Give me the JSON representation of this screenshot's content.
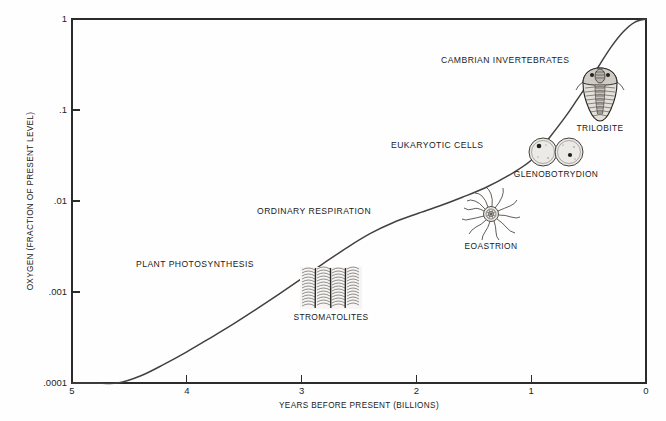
{
  "figure": {
    "background_color": "#fefefe",
    "curve_color": "#44403f",
    "axis_color": "#2b2b2b"
  },
  "chart_data": {
    "type": "line",
    "title": "",
    "xlabel": "YEARS BEFORE PRESENT (BILLIONS)",
    "ylabel": "OXYGEN (FRACTION OF PRESENT LEVEL)",
    "yscale": "log",
    "xlim": [
      5,
      0
    ],
    "ylim": [
      0.0001,
      1
    ],
    "x_reversed": true,
    "grid": false,
    "legend": "none",
    "xticks": [
      "5",
      "4",
      "3",
      "2",
      "1",
      "0"
    ],
    "xtick_values": [
      5,
      4,
      3,
      2,
      1,
      0
    ],
    "yticks": [
      "1",
      ".1",
      ".01",
      ".001",
      ".0001"
    ],
    "ytick_values": [
      1,
      0.1,
      0.01,
      0.001,
      0.0001
    ],
    "series": [
      {
        "name": "Atmospheric oxygen",
        "x": [
          5.0,
          4.8,
          4.6,
          4.4,
          4.2,
          4.0,
          3.8,
          3.6,
          3.4,
          3.2,
          3.0,
          2.8,
          2.6,
          2.4,
          2.2,
          2.0,
          1.8,
          1.6,
          1.4,
          1.2,
          1.0,
          0.85,
          0.7,
          0.6,
          0.5,
          0.4,
          0.3,
          0.2,
          0.1,
          0.0
        ],
        "y": [
          0.0001,
          0.0001,
          0.0001,
          0.00012,
          0.00016,
          0.00022,
          0.00031,
          0.00044,
          0.00064,
          0.00094,
          0.0014,
          0.0021,
          0.0031,
          0.0044,
          0.0058,
          0.0072,
          0.0088,
          0.011,
          0.014,
          0.019,
          0.028,
          0.048,
          0.085,
          0.13,
          0.2,
          0.32,
          0.5,
          0.72,
          0.92,
          1.0
        ]
      }
    ],
    "annotations": [
      {
        "text": "PLANT PHOTOSYNTHESIS",
        "x_px": 136,
        "y_px": 267
      },
      {
        "text": "ORDINARY RESPIRATION",
        "x_px": 257,
        "y_px": 214
      },
      {
        "text": "EUKARYOTIC CELLS",
        "x_px": 391,
        "y_px": 148
      },
      {
        "text": "CAMBRIAN INVERTEBRATES",
        "x_px": 441,
        "y_px": 63
      }
    ],
    "fossil_illustrations": [
      {
        "name": "stromatolites-illustration",
        "caption": "STROMATOLITES",
        "x_px": 300,
        "y_px": 267,
        "width_px": 62,
        "height_px": 42
      },
      {
        "name": "eoastrion-illustration",
        "caption": "EOASTRION",
        "x_px": 460,
        "y_px": 190,
        "width_px": 62,
        "height_px": 46
      },
      {
        "name": "glenobotrydion-illustration",
        "caption": "GLENOBOTRYDION",
        "x_px": 528,
        "y_px": 136,
        "width_px": 56,
        "height_px": 33
      },
      {
        "name": "trilobite-illustration",
        "caption": "TRILOBITE",
        "x_px": 576,
        "y_px": 66,
        "width_px": 48,
        "height_px": 56
      }
    ]
  }
}
